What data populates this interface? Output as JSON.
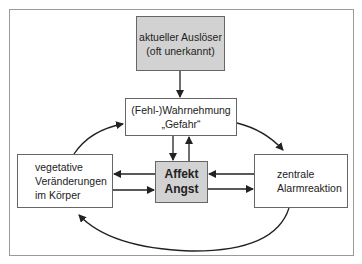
{
  "diagram": {
    "trigger": {
      "lines": [
        "aktueller Auslöser",
        "(oft unerkannt)"
      ]
    },
    "perception": {
      "lines": [
        "(Fehl-)Wahrnehmung",
        "„Gefahr“"
      ]
    },
    "affect": {
      "lines": [
        "Affekt",
        "Angst"
      ]
    },
    "vegetative": {
      "lines": [
        "vegetative",
        "Veränderungen",
        "im Körper"
      ]
    },
    "alarm": {
      "lines": [
        "zentrale",
        "Alarmreaktion"
      ]
    },
    "edges": [
      {
        "from": "trigger",
        "to": "perception"
      },
      {
        "from": "perception",
        "to": "affect"
      },
      {
        "from": "affect",
        "to": "perception"
      },
      {
        "from": "affect",
        "to": "vegetative"
      },
      {
        "from": "vegetative",
        "to": "affect"
      },
      {
        "from": "alarm",
        "to": "affect"
      },
      {
        "from": "affect",
        "to": "alarm"
      },
      {
        "from": "vegetative",
        "to": "perception",
        "curved": true
      },
      {
        "from": "perception",
        "to": "alarm",
        "curved": true
      },
      {
        "from": "alarm",
        "to": "vegetative",
        "curved": true
      }
    ],
    "colors": {
      "highlight_fill": "#d2d2d2",
      "border": "#666666",
      "frame": "#9a9a9a",
      "arrow": "#222222"
    }
  }
}
